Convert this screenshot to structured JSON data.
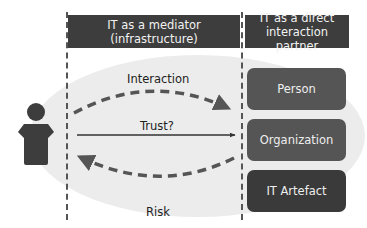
{
  "headers": {
    "mediator": "IT as a mediator (infrastructure)",
    "mediator_line1": "IT as a mediator",
    "mediator_line2": "(infrastructure)",
    "partner_line1": "IT as a direct",
    "partner_line2": "interaction partner"
  },
  "flows": {
    "interaction": "Interaction",
    "trust": "Trust?",
    "risk": "Risk"
  },
  "entities": [
    {
      "label": "Person",
      "color": "#555555"
    },
    {
      "label": "Organization",
      "color": "#555555"
    },
    {
      "label": "IT Artefact",
      "color": "#3a3a3a"
    }
  ],
  "actor": {
    "icon": "person-icon"
  },
  "colors": {
    "header_bg": "#3d3d3d",
    "background_ellipse": "#ececec",
    "arrow": "#555555"
  }
}
